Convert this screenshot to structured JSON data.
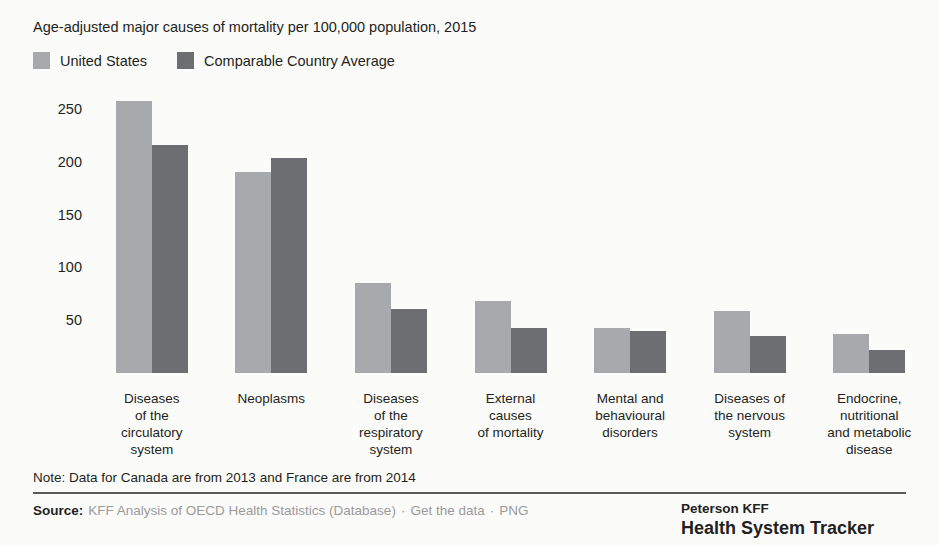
{
  "chart_data": {
    "type": "bar",
    "title": "Age-adjusted major causes of mortality per 100,000 population, 2015",
    "xlabel": "",
    "ylabel": "",
    "ylim": [
      0,
      270
    ],
    "yticks": [
      50,
      100,
      150,
      200,
      250
    ],
    "grid": false,
    "legend_position": "top-left",
    "categories": [
      "Diseases of the circulatory system",
      "Neoplasms",
      "Diseases of the respiratory system",
      "External causes of mortality",
      "Mental and behavioural disorders",
      "Diseases of the nervous system",
      "Endocrine, nutritional and metabolic disease"
    ],
    "category_lines": [
      [
        "Diseases",
        "of the",
        "circulatory",
        "system"
      ],
      [
        "Neoplasms"
      ],
      [
        "Diseases",
        "of the",
        "respiratory",
        "system"
      ],
      [
        "External",
        "causes",
        "of mortality"
      ],
      [
        "Mental and",
        "behavioural",
        "disorders"
      ],
      [
        "Diseases of",
        "the nervous",
        "system"
      ],
      [
        "Endocrine,",
        "nutritional",
        "and metabolic",
        "disease"
      ]
    ],
    "series": [
      {
        "name": "United States",
        "color": "#a7a9ac",
        "values": [
          258,
          190,
          85,
          68,
          43,
          59,
          37
        ]
      },
      {
        "name": "Comparable Country Average",
        "color": "#6d6e71",
        "values": [
          216,
          204,
          61,
          43,
          40,
          35,
          22
        ]
      }
    ]
  },
  "legend": {
    "items": [
      {
        "label": "United States",
        "color": "#a7a9ac"
      },
      {
        "label": "Comparable Country Average",
        "color": "#6d6e71"
      }
    ]
  },
  "note": {
    "text": "Note: Data for Canada are from 2013 and France are from 2014"
  },
  "source": {
    "label": "Source:",
    "citation": "KFF Analysis of OECD Health Statistics (Database)",
    "separator": "·",
    "get_data_link": "Get the data",
    "png_link": "PNG"
  },
  "brand": {
    "top": "Peterson KFF",
    "bottom": "Health System Tracker"
  },
  "colors": {
    "united_states": "#a7a9ac",
    "comparable": "#6d6e71",
    "text": "#231f20",
    "muted": "#9a9a9a",
    "rule": "#58595b"
  }
}
